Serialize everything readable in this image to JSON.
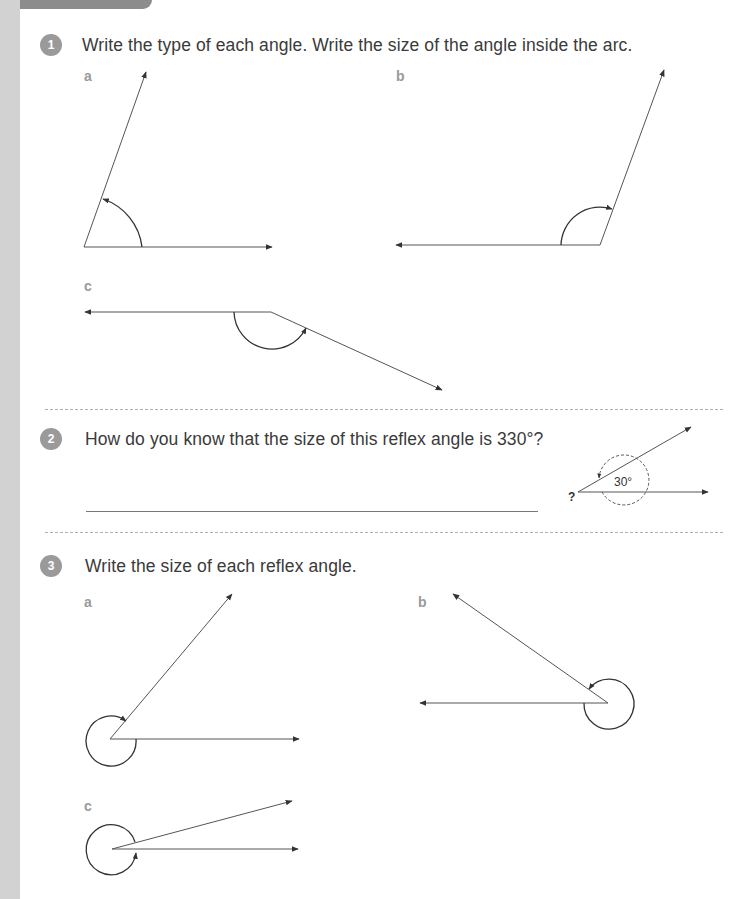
{
  "page": {
    "colors": {
      "left_strip": "#d2d2d2",
      "top_tab": "#8c8c8c",
      "badge": "#9a9a9a",
      "sub_label": "#9a9a9a",
      "line": "#555555"
    }
  },
  "questions": [
    {
      "number": "1",
      "prompt": "Write the type of each angle. Write the size of the angle inside the arc.",
      "parts": [
        {
          "label": "a",
          "arc": "inside acute side",
          "type_hint": "obtuse/acute figure"
        },
        {
          "label": "b"
        },
        {
          "label": "c"
        }
      ]
    },
    {
      "number": "2",
      "prompt": "How do you know that the size of this reflex angle is 330°?",
      "diagram": {
        "known_angle": "30°",
        "unknown_marker": "?"
      },
      "answer_line": true
    },
    {
      "number": "3",
      "prompt": "Write the size of each reflex angle.",
      "parts": [
        {
          "label": "a"
        },
        {
          "label": "b"
        },
        {
          "label": "c"
        }
      ]
    }
  ]
}
